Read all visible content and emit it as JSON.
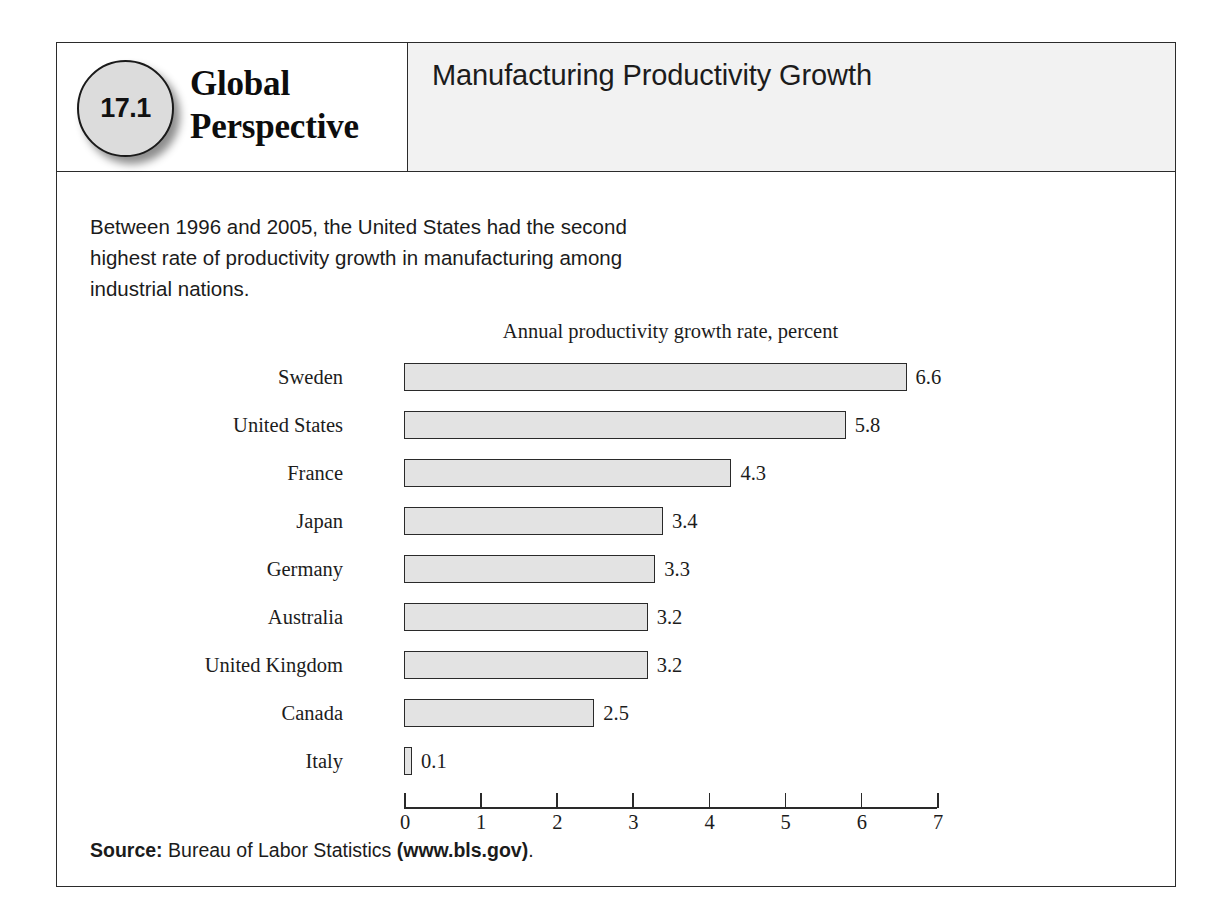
{
  "box": {
    "chapter_number": "17.1",
    "series_line1": "Global",
    "series_line2": "Perspective",
    "panel_title": "Manufacturing Productivity Growth",
    "intro_text": "Between 1996 and 2005, the United States had the second highest rate of productivity growth in manufacturing among industrial nations.",
    "source_prefix": "Source:",
    "source_text": "Bureau of Labor Statistics",
    "source_url": "(www.bls.gov)",
    "source_suffix": "."
  },
  "colors": {
    "bar_fill": "#e3e3e3",
    "bar_stroke": "#2a2a2a",
    "border": "#2b2b2b",
    "header_right_bg": "#f2f2f2",
    "badge_fill": "#dcdcdc"
  },
  "chart_data": {
    "type": "bar",
    "orientation": "horizontal",
    "title": "Annual productivity growth rate, percent",
    "xlabel": "",
    "ylabel": "",
    "xlim": [
      0,
      7
    ],
    "xticks": [
      0,
      1,
      2,
      3,
      4,
      5,
      6,
      7
    ],
    "xtick_labels": [
      "0",
      "1",
      "2",
      "3",
      "4",
      "5",
      "6",
      "7"
    ],
    "grid": false,
    "legend": "none",
    "categories": [
      "Sweden",
      "United States",
      "France",
      "Japan",
      "Germany",
      "Australia",
      "United Kingdom",
      "Canada",
      "Italy"
    ],
    "values": [
      6.6,
      5.8,
      4.3,
      3.4,
      3.3,
      3.2,
      3.2,
      2.5,
      0.1
    ],
    "value_labels": [
      "6.6",
      "5.8",
      "4.3",
      "3.4",
      "3.3",
      "3.2",
      "3.2",
      "2.5",
      "0.1"
    ]
  }
}
